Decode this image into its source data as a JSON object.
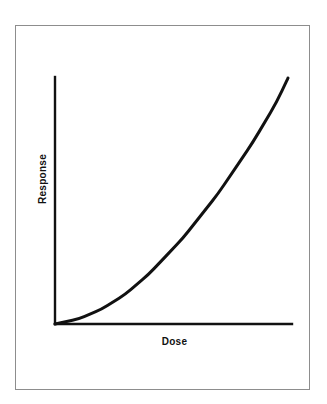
{
  "figure": {
    "background_color": "#ffffff",
    "frame_color": "#8d8d8d",
    "ink_color": "#111111"
  },
  "chart_data": {
    "type": "line",
    "title": "",
    "subtitle": "",
    "xlabel": "Dose",
    "ylabel": "Response",
    "legend": [],
    "annotations": [],
    "grid": false,
    "xlim": [
      0,
      1
    ],
    "ylim": [
      0,
      1
    ],
    "x_tick_labels": [],
    "y_tick_labels": [],
    "series": [
      {
        "name": "Dose-response",
        "color": "#111111",
        "line_width": 3,
        "x": [
          0.0,
          0.05,
          0.1,
          0.15,
          0.2,
          0.25,
          0.3,
          0.35,
          0.4,
          0.45,
          0.5,
          0.55,
          0.6,
          0.65,
          0.7,
          0.75,
          0.8,
          0.85,
          0.9,
          0.95,
          1.0
        ],
        "y": [
          0.0,
          0.01,
          0.02,
          0.04,
          0.06,
          0.09,
          0.12,
          0.16,
          0.2,
          0.25,
          0.3,
          0.35,
          0.41,
          0.47,
          0.53,
          0.6,
          0.67,
          0.74,
          0.82,
          0.9,
          1.0
        ]
      }
    ]
  },
  "axes": {
    "x_axis_name": "dose-axis",
    "y_axis_name": "response-axis"
  }
}
